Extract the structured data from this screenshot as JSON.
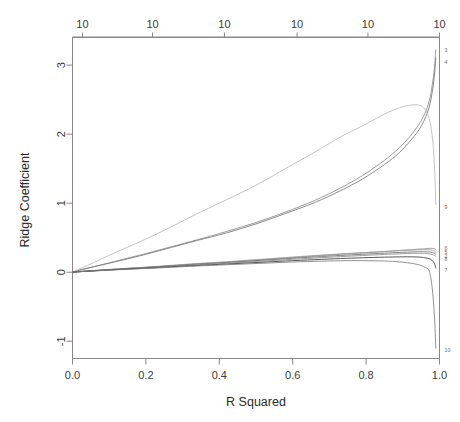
{
  "chart_data": {
    "type": "line",
    "title": "",
    "xlabel": "R Squared",
    "ylabel": "Ridge Coefficient",
    "xlim": [
      0.0,
      1.0
    ],
    "ylim": [
      -1.25,
      3.4
    ],
    "grid": false,
    "legend": "right-margin-series-labels",
    "x_ticks": [
      "0.0",
      "0.2",
      "0.4",
      "0.6",
      "0.8",
      "1.0"
    ],
    "x_tick_values": [
      0.0,
      0.2,
      0.4,
      0.6,
      0.8,
      1.0
    ],
    "y_ticks": [
      "-1",
      "0",
      "1",
      "2",
      "3"
    ],
    "y_tick_values": [
      -1,
      0,
      1,
      2,
      3
    ],
    "top_axis": {
      "label": "",
      "ticks": [
        "10",
        "10",
        "10",
        "10",
        "10",
        "10"
      ],
      "tick_positions": [
        0.027,
        0.218,
        0.414,
        0.612,
        0.805,
        1.0
      ]
    },
    "series_labels": [
      "3",
      "4",
      "9",
      "6",
      "5",
      "2",
      "8",
      "7",
      "10"
    ],
    "x": [
      0.0,
      0.02,
      0.05,
      0.09,
      0.14,
      0.2,
      0.27,
      0.34,
      0.42,
      0.5,
      0.58,
      0.66,
      0.73,
      0.79,
      0.85,
      0.89,
      0.92,
      0.945,
      0.96,
      0.972,
      0.98,
      0.986,
      0.99
    ],
    "series": [
      {
        "name": "3",
        "label": "3",
        "end_value": 3.22,
        "color": "#8a8a8a",
        "values": [
          0.0,
          0.03,
          0.07,
          0.12,
          0.19,
          0.27,
          0.37,
          0.47,
          0.59,
          0.72,
          0.87,
          1.04,
          1.22,
          1.4,
          1.62,
          1.8,
          1.97,
          2.15,
          2.3,
          2.48,
          2.7,
          2.95,
          3.22
        ]
      },
      {
        "name": "4",
        "label": "4",
        "end_value": 3.1,
        "color": "#777777",
        "values": [
          0.0,
          0.03,
          0.07,
          0.12,
          0.18,
          0.26,
          0.36,
          0.46,
          0.57,
          0.7,
          0.85,
          1.01,
          1.18,
          1.35,
          1.56,
          1.73,
          1.9,
          2.07,
          2.22,
          2.39,
          2.6,
          2.84,
          3.1
        ]
      },
      {
        "name": "9",
        "label": "9",
        "end_value": 0.98,
        "color": "#b9b9b9",
        "values": [
          0.0,
          0.05,
          0.12,
          0.22,
          0.34,
          0.48,
          0.66,
          0.85,
          1.05,
          1.26,
          1.5,
          1.74,
          1.96,
          2.12,
          2.29,
          2.38,
          2.42,
          2.42,
          2.36,
          2.22,
          1.98,
          1.58,
          0.98
        ]
      },
      {
        "name": "6",
        "label": "6",
        "end_value": 0.33,
        "color": "#8f8f8f",
        "values": [
          0.0,
          0.01,
          0.02,
          0.035,
          0.05,
          0.07,
          0.095,
          0.12,
          0.145,
          0.175,
          0.205,
          0.235,
          0.26,
          0.28,
          0.3,
          0.315,
          0.325,
          0.335,
          0.34,
          0.345,
          0.345,
          0.34,
          0.33
        ]
      },
      {
        "name": "5",
        "label": "5",
        "end_value": 0.29,
        "color": "#9a9a9a",
        "values": [
          0.0,
          0.01,
          0.022,
          0.037,
          0.054,
          0.074,
          0.1,
          0.126,
          0.152,
          0.182,
          0.212,
          0.241,
          0.265,
          0.283,
          0.3,
          0.312,
          0.32,
          0.325,
          0.326,
          0.324,
          0.318,
          0.306,
          0.29
        ]
      },
      {
        "name": "2",
        "label": "2",
        "end_value": 0.26,
        "color": "#6f6f6f",
        "values": [
          0.0,
          0.009,
          0.02,
          0.034,
          0.05,
          0.068,
          0.092,
          0.116,
          0.14,
          0.167,
          0.195,
          0.221,
          0.243,
          0.26,
          0.276,
          0.286,
          0.293,
          0.297,
          0.297,
          0.293,
          0.286,
          0.275,
          0.26
        ]
      },
      {
        "name": "8",
        "label": "8",
        "end_value": 0.23,
        "color": "#8b8b8b",
        "values": [
          0.0,
          0.008,
          0.018,
          0.031,
          0.046,
          0.063,
          0.085,
          0.107,
          0.13,
          0.155,
          0.181,
          0.205,
          0.226,
          0.242,
          0.257,
          0.266,
          0.272,
          0.274,
          0.272,
          0.266,
          0.257,
          0.245,
          0.23
        ]
      },
      {
        "name": "7",
        "label": "7",
        "end_value": 0.06,
        "color": "#3b3b3b",
        "values": [
          0.0,
          0.008,
          0.017,
          0.029,
          0.043,
          0.058,
          0.078,
          0.098,
          0.118,
          0.14,
          0.162,
          0.182,
          0.198,
          0.209,
          0.218,
          0.222,
          0.223,
          0.219,
          0.21,
          0.196,
          0.172,
          0.128,
          0.06
        ]
      },
      {
        "name": "10",
        "label": "10",
        "end_value": -1.1,
        "color": "#7d7d7d",
        "values": [
          0.0,
          0.007,
          0.016,
          0.027,
          0.04,
          0.054,
          0.072,
          0.09,
          0.108,
          0.126,
          0.144,
          0.158,
          0.166,
          0.168,
          0.162,
          0.15,
          0.132,
          0.105,
          0.072,
          0.018,
          -0.22,
          -0.62,
          -1.1
        ]
      }
    ],
    "series_label_y": {
      "3": 3.22,
      "4": 3.05,
      "9": 0.95,
      "6": 0.345,
      "5": 0.29,
      "2": 0.235,
      "8": 0.185,
      "7": 0.03,
      "10": -1.12
    }
  },
  "axes": {
    "y_title": "Ridge Coefficient",
    "x_title": "R Squared"
  }
}
